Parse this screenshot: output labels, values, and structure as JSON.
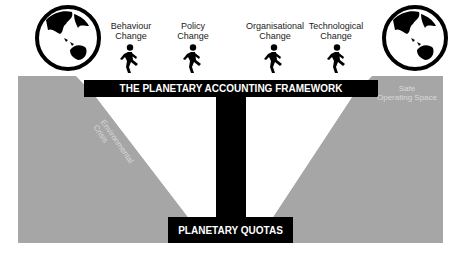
{
  "diagram": {
    "framework_label": "THE PLANETARY ACCOUNTING FRAMEWORK",
    "quotas_label": "PLANETARY QUOTAS",
    "left_region_label": "Environmental Crisis",
    "right_region_label_line1": "Safe",
    "right_region_label_line2": "Operating Space",
    "actors": [
      {
        "line1": "Behaviour",
        "line2": "Change",
        "icon": "walking-person-icon"
      },
      {
        "line1": "Policy",
        "line2": "Change",
        "icon": "walking-person-icon"
      },
      {
        "line1": "Organisational",
        "line2": "Change",
        "icon": "walking-person-icon"
      },
      {
        "line1": "Technological",
        "line2": "Change",
        "icon": "walking-person-icon"
      }
    ],
    "globes": [
      {
        "position": "left",
        "icon": "globe-icon"
      },
      {
        "position": "right",
        "icon": "globe-icon"
      }
    ],
    "colors": {
      "region_grey": "#a6a6a6",
      "bar_black": "#000000",
      "background": "#ffffff"
    }
  }
}
